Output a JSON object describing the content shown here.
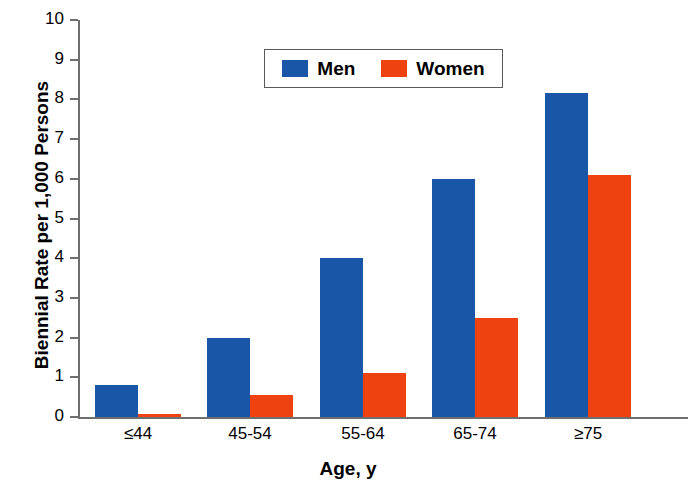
{
  "chart_data": {
    "type": "bar",
    "title": "",
    "xlabel": "Age, y",
    "ylabel": "Biennial Rate per 1,000 Persons",
    "categories": [
      "≤44",
      "45-54",
      "55-64",
      "65-74",
      "≥75"
    ],
    "series": [
      {
        "name": "Men",
        "color": "#1a56a8",
        "values": [
          0.8,
          2.0,
          4.0,
          6.0,
          8.15
        ]
      },
      {
        "name": "Women",
        "color": "#ee4310",
        "values": [
          0.08,
          0.55,
          1.1,
          2.5,
          6.1
        ]
      }
    ],
    "ylim": [
      0,
      10
    ],
    "yticks": [
      0,
      1,
      2,
      3,
      4,
      5,
      6,
      7,
      8,
      9,
      10
    ],
    "ytick_labels": [
      "0",
      "1",
      "2",
      "3",
      "4",
      "5",
      "6",
      "7",
      "8",
      "9",
      "10"
    ],
    "grid": false,
    "legend_position": "upper center",
    "legend_entries": [
      "Men",
      "Women"
    ]
  },
  "axes": {
    "y_title": "Biennial Rate per 1,000 Persons",
    "x_title": "Age, y"
  },
  "legend": {
    "items": [
      {
        "label": "Men",
        "swatch": "legend-swatch-blue"
      },
      {
        "label": "Women",
        "swatch": "legend-swatch-orange"
      }
    ]
  },
  "colors": {
    "men": "#1a56a8",
    "women": "#ee4310",
    "axis": "#6e6e6e",
    "text": "#000000",
    "background": "#ffffff"
  }
}
